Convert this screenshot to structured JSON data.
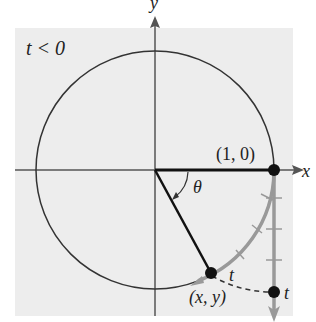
{
  "diagram": {
    "condition_label": "t < 0",
    "x_axis_label": "x",
    "y_axis_label": "y",
    "point_1_0_label": "(1, 0)",
    "angle_label": "θ",
    "arc_point_label": "t",
    "line_point_label": "t",
    "xy_point_label": "(x, y)",
    "colors": {
      "background": "#ededed",
      "axes": "#555555",
      "circle": "#333333",
      "radius": "#111111",
      "wrap_line": "#999999",
      "point": "#111111"
    }
  }
}
